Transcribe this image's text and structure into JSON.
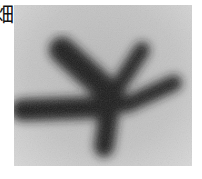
{
  "caption_fragment": "畑",
  "image": {
    "subject": "dark blurred star-shaped branching blob on grey textured background",
    "colors": {
      "background": "#c2c2c2",
      "shape": "#1a1a1a"
    }
  }
}
